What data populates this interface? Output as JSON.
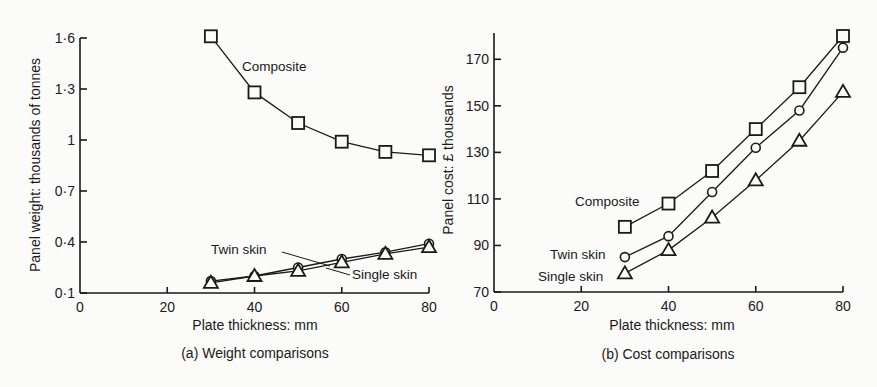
{
  "chart_data": [
    {
      "type": "line",
      "title": "(a) Weight comparisons",
      "xlabel": "Plate thickness: mm",
      "ylabel": "Panel weight: thousands of tonnes",
      "xlim": [
        0,
        80
      ],
      "ylim": [
        0.1,
        1.6
      ],
      "xticks": [
        "0",
        "20",
        "40",
        "60",
        "80"
      ],
      "yticks": [
        "0·1",
        "0·4",
        "0·7",
        "1",
        "1·3",
        "1·6"
      ],
      "grid": false,
      "legend": "inline labels",
      "x": [
        30,
        40,
        50,
        60,
        70,
        80
      ],
      "series": [
        {
          "name": "Composite",
          "marker": "square",
          "values": [
            1.61,
            1.28,
            1.1,
            0.99,
            0.93,
            0.91
          ]
        },
        {
          "name": "Twin skin",
          "marker": "circle",
          "values": [
            0.17,
            0.2,
            0.25,
            0.3,
            0.34,
            0.39
          ]
        },
        {
          "name": "Single skin",
          "marker": "triangle",
          "values": [
            0.16,
            0.2,
            0.23,
            0.28,
            0.33,
            0.37
          ]
        }
      ]
    },
    {
      "type": "line",
      "title": "(b) Cost comparisons",
      "xlabel": "Plate thickness: mm",
      "ylabel": "Panel cost: £ thousands",
      "xlim": [
        0,
        80
      ],
      "ylim": [
        70,
        180
      ],
      "xticks": [
        "0",
        "20",
        "40",
        "60",
        "80"
      ],
      "yticks": [
        "70",
        "90",
        "110",
        "130",
        "150",
        "170"
      ],
      "grid": false,
      "legend": "inline labels",
      "x": [
        30,
        40,
        50,
        60,
        70,
        80
      ],
      "series": [
        {
          "name": "Composite",
          "marker": "square",
          "values": [
            98,
            108,
            122,
            140,
            158,
            180
          ]
        },
        {
          "name": "Twin skin",
          "marker": "circle",
          "values": [
            85,
            94,
            113,
            132,
            148,
            175
          ]
        },
        {
          "name": "Single skin",
          "marker": "triangle",
          "values": [
            78,
            88,
            102,
            118,
            135,
            156
          ]
        }
      ]
    }
  ],
  "left": {
    "caption": "(a) Weight comparisons",
    "xlabel": "Plate thickness: mm",
    "ylabel": "Panel weight: thousands of tonnes",
    "label_composite": "Composite",
    "label_twin": "Twin skin",
    "label_single": "Single skin"
  },
  "right": {
    "caption": "(b) Cost comparisons",
    "xlabel": "Plate thickness: mm",
    "ylabel": "Panel cost: £ thousands",
    "label_composite": "Composite",
    "label_twin": "Twin skin",
    "label_single": "Single skin"
  },
  "colors": {
    "ink": "#1a1a1a",
    "paper": "#fbfbf9"
  }
}
